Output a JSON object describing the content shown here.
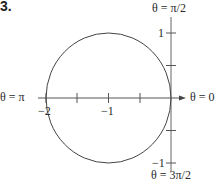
{
  "problem_number": "3.",
  "labels": {
    "theta_top": "θ = π/2",
    "theta_bottom": "θ = 3π/2",
    "theta_left": "θ = π",
    "theta_right": "θ = 0",
    "tick_x_neg2": "−2",
    "tick_x_neg1": "−1",
    "tick_y_1": "1",
    "tick_y_neg1": "−1"
  },
  "geometry": {
    "origin_px": [
      171,
      98
    ],
    "x_unit_px": 62.5,
    "y_unit_px": 65,
    "circle_center": [
      -1,
      0
    ],
    "circle_radius": 1,
    "x_ticks": [
      -2,
      -1.5,
      -1,
      -0.5
    ],
    "y_ticks": [
      1,
      0.5,
      -0.5,
      -1
    ]
  },
  "colors": {
    "axis": "#555555",
    "curve": "#444444",
    "text": "#2a2a2a"
  }
}
